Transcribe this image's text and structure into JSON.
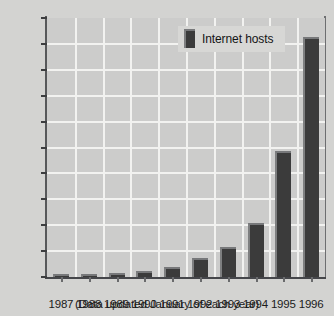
{
  "chart_data": {
    "type": "bar",
    "title": "",
    "subtitle": "",
    "xlabel": "",
    "ylabel": "",
    "categories": [
      "1987",
      "1988",
      "1989",
      "1990",
      "1991",
      "1992",
      "1993",
      "1994",
      "1995",
      "1996"
    ],
    "series": [
      {
        "name": "Internet hosts",
        "values": [
          30,
          80,
          150,
          250,
          400,
          750,
          1150,
          2100,
          4850,
          9250
        ]
      }
    ],
    "ylim": [
      0,
      10000
    ],
    "yticks": [
      0,
      1000,
      2000,
      3000,
      4000,
      5000,
      6000,
      7000,
      8000,
      9000,
      10000
    ],
    "ytick_labels": [
      "0",
      "1,000",
      "2,000",
      "3,000",
      "4,000",
      "5,000",
      "6,000",
      "7,000",
      "8,000",
      "9,000",
      "10,000"
    ],
    "grid": true,
    "grid_axis": "both",
    "legend": {
      "position": "top-right-inside",
      "entries": [
        {
          "label": "Internet hosts",
          "color": "#3b3b3b",
          "swatch_name": "bar-swatch"
        }
      ]
    },
    "annotations": [
      {
        "name": "footnote",
        "text": "(Data updated January of each year)"
      }
    ],
    "colors": {
      "figure_background": "#d3d3d1",
      "plot_background": "#cccccb",
      "bar_fill": "#3b3b3b",
      "bar_highlight": "#7e7f80",
      "gridline": "#f2f2f0",
      "axis": "#45464a",
      "text": "#1b1b1b",
      "legend_background": "#d7d7d5"
    }
  },
  "caption": "(Data updated January of each year)"
}
